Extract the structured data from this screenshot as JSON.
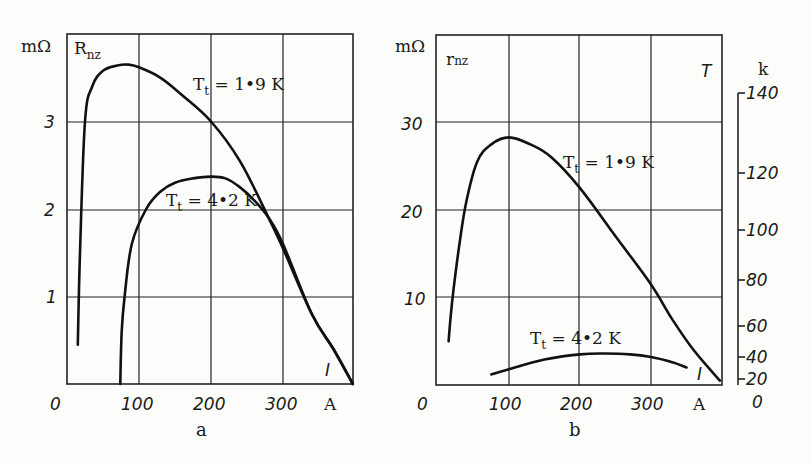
{
  "figure": {
    "panels": [
      {
        "id": "a",
        "caption": "a",
        "y_quantity": "R",
        "y_quantity_sub": "nz",
        "y_unit": "mΩ",
        "x_unit": "A",
        "x_quantity": "I",
        "x_ticks": [
          "0",
          "100",
          "200",
          "300"
        ],
        "y_ticks": [
          "1",
          "2",
          "3"
        ],
        "curve_labels": [
          {
            "text": "T",
            "sub": "t",
            "rest": " = 1",
            "dot": "•",
            "tail": "9 K"
          },
          {
            "text": "T",
            "sub": "t",
            "rest": " = 4",
            "dot": "•",
            "tail": "2 K"
          }
        ]
      },
      {
        "id": "b",
        "caption": "b",
        "y_quantity": "r",
        "y_quantity_sub": "nz",
        "y_unit": "mΩ",
        "x_unit": "A",
        "x_quantity": "I",
        "x_ticks": [
          "0",
          "100",
          "200",
          "300"
        ],
        "y_ticks": [
          "10",
          "20",
          "30"
        ],
        "secondary_axis_label": "T",
        "secondary_unit": "k",
        "secondary_ticks": [
          "140",
          "120",
          "100",
          "80",
          "60",
          "40",
          "20",
          "0"
        ],
        "curve_labels": [
          {
            "text": "T",
            "sub": "t",
            "rest": " = 1",
            "dot": "•",
            "tail": "9 K"
          },
          {
            "text": "T",
            "sub": "t",
            "rest": " = 4",
            "dot": "•",
            "tail": "2 K"
          }
        ]
      }
    ]
  },
  "chart_data": [
    {
      "type": "line",
      "title": "a",
      "xlabel": "I (A)",
      "ylabel": "R_nz (mΩ)",
      "xlim": [
        0,
        397
      ],
      "ylim": [
        0,
        4
      ],
      "grid": true,
      "x_ticks": [
        0,
        100,
        200,
        300
      ],
      "y_ticks": [
        1,
        2,
        3
      ],
      "series": [
        {
          "name": "T_t = 1.9 K",
          "x": [
            15,
            18,
            25,
            35,
            50,
            70,
            85,
            100,
            130,
            160,
            200,
            240,
            280,
            300,
            340,
            370,
            397
          ],
          "values": [
            0.45,
            1.5,
            3.0,
            3.4,
            3.58,
            3.64,
            3.65,
            3.62,
            3.5,
            3.3,
            3.0,
            2.55,
            1.9,
            1.55,
            0.8,
            0.4,
            0.0
          ]
        },
        {
          "name": "T_t = 4.2 K",
          "x": [
            74,
            76,
            80,
            90,
            110,
            130,
            150,
            175,
            200,
            220,
            240,
            260,
            280,
            300,
            340,
            370,
            397
          ],
          "values": [
            0.0,
            0.6,
            1.0,
            1.6,
            2.0,
            2.2,
            2.3,
            2.35,
            2.37,
            2.35,
            2.25,
            2.1,
            1.9,
            1.6,
            0.8,
            0.4,
            0.0
          ]
        }
      ]
    },
    {
      "type": "line",
      "title": "b",
      "xlabel": "I (A)",
      "ylabel": "r_nz (mΩ)",
      "secondary_ylabel": "T (k)",
      "xlim": [
        0,
        400
      ],
      "ylim": [
        0,
        40
      ],
      "grid": true,
      "x_ticks": [
        0,
        100,
        200,
        300
      ],
      "y_ticks": [
        10,
        20,
        30
      ],
      "secondary_ticks": [
        0,
        20,
        40,
        60,
        80,
        100,
        120,
        140
      ],
      "series": [
        {
          "name": "T_t = 1.9 K",
          "x": [
            15,
            18,
            22,
            30,
            40,
            55,
            75,
            100,
            130,
            160,
            200,
            250,
            300,
            330,
            360,
            397
          ],
          "values": [
            5.0,
            8.0,
            11.0,
            16.0,
            21.0,
            25.5,
            27.5,
            28.3,
            27.5,
            26.0,
            22.5,
            17.0,
            11.5,
            7.5,
            4.0,
            0.5
          ]
        },
        {
          "name": "T_t = 4.2 K",
          "x": [
            75,
            100,
            150,
            200,
            235,
            270,
            300,
            330,
            350
          ],
          "values": [
            1.2,
            1.8,
            2.9,
            3.5,
            3.6,
            3.5,
            3.2,
            2.6,
            2.0
          ]
        }
      ]
    }
  ]
}
